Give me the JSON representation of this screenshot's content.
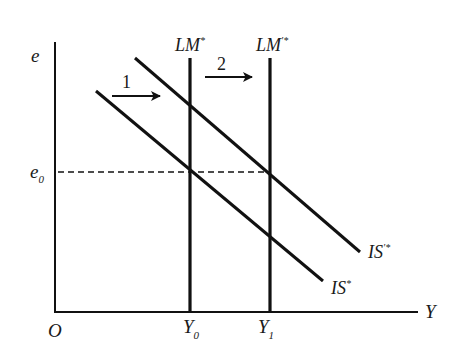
{
  "diagram": {
    "type": "IS-LM* (Mundell-Fleming) diagram",
    "axes": {
      "y_label": "e",
      "x_label": "Y",
      "origin_label": "O"
    },
    "curves": {
      "lm_initial": {
        "label_main": "LM",
        "label_sup": "*"
      },
      "lm_shifted": {
        "label_main": "LM",
        "label_sup": "′*"
      },
      "is_initial": {
        "label_main": "IS",
        "label_sup": "*"
      },
      "is_shifted": {
        "label_main": "IS",
        "label_sup": "′*"
      }
    },
    "levels": {
      "e0": {
        "main": "e",
        "sub": "0"
      },
      "y0": {
        "main": "Y",
        "sub": "0"
      },
      "y1": {
        "main": "Y",
        "sub": "1"
      }
    },
    "arrows": [
      {
        "label": "1",
        "description": "IS* shifts right"
      },
      {
        "label": "2",
        "description": "LM* shifts right"
      }
    ],
    "colors": {
      "line": "#111111",
      "background": "#ffffff"
    }
  }
}
